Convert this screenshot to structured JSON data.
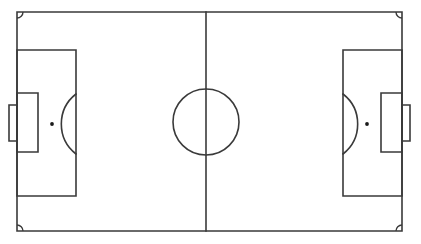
{
  "diagram": {
    "type": "soccer-pitch-schematic",
    "orientation": "landscape",
    "caption": ""
  },
  "canvas": {
    "width": 421,
    "height": 244,
    "background_color": "#ffffff"
  },
  "style": {
    "line_color": "#3a3a3a",
    "line_width": 1.6,
    "spot_color": "#1a1a1a",
    "surface_color": "#ffffff"
  },
  "field": {
    "label": "Field of play",
    "left": 17,
    "top": 12,
    "right": 402,
    "bottom": 231,
    "width": 385,
    "height": 219
  },
  "halfway_line": {
    "label": "Halfway line",
    "x": 206,
    "y1": 12,
    "y2": 231
  },
  "center_circle": {
    "label": "Centre circle",
    "cx": 206,
    "cy": 122,
    "r": 33
  },
  "center_mark": {
    "label": "Centre mark",
    "cx": 206,
    "cy": 122,
    "r": 0,
    "visible": false
  },
  "corner_arcs": [
    {
      "label": "Top-left corner arc",
      "cx": 17,
      "cy": 12,
      "r": 6,
      "sweep": "top-left"
    },
    {
      "label": "Top-right corner arc",
      "cx": 402,
      "cy": 12,
      "r": 6,
      "sweep": "top-right"
    },
    {
      "label": "Bottom-left corner arc",
      "cx": 17,
      "cy": 231,
      "r": 6,
      "sweep": "bottom-left"
    },
    {
      "label": "Bottom-right corner arc",
      "cx": 402,
      "cy": 231,
      "r": 6,
      "sweep": "bottom-right"
    }
  ],
  "left_half": {
    "label": "Left half",
    "penalty_area": {
      "label": "Penalty area",
      "x": 17,
      "y": 50,
      "width": 59,
      "height": 146
    },
    "goal_area": {
      "label": "Goal area",
      "x": 17,
      "y": 93,
      "width": 21,
      "height": 59
    },
    "penalty_spot": {
      "label": "Penalty mark",
      "cx": 52,
      "cy": 124,
      "r": 1.9
    },
    "penalty_arc": {
      "label": "Penalty arc",
      "cx": 52,
      "cy": 124,
      "r": 38,
      "chord_x": 76,
      "y_top": 94,
      "y_bottom": 154,
      "bulge_x": 90
    },
    "goal": {
      "label": "Goal",
      "x": 9,
      "y": 105,
      "width": 8,
      "height": 36
    }
  },
  "right_half": {
    "label": "Right half",
    "penalty_area": {
      "label": "Penalty area",
      "x": 343,
      "y": 50,
      "width": 59,
      "height": 146
    },
    "goal_area": {
      "label": "Goal area",
      "x": 381,
      "y": 93,
      "width": 21,
      "height": 59
    },
    "penalty_spot": {
      "label": "Penalty mark",
      "cx": 367,
      "cy": 124,
      "r": 1.9
    },
    "penalty_arc": {
      "label": "Penalty arc",
      "cx": 367,
      "cy": 124,
      "r": 38,
      "chord_x": 343,
      "y_top": 94,
      "y_bottom": 154,
      "bulge_x": 329
    },
    "goal": {
      "label": "Goal",
      "x": 402,
      "y": 105,
      "width": 8,
      "height": 36
    }
  }
}
